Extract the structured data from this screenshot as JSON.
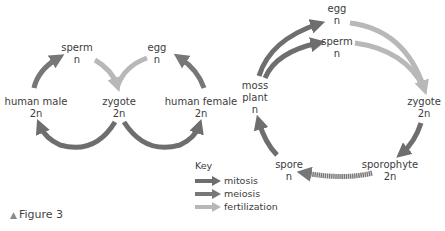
{
  "colors": {
    "mitosis": "#6e6e6e",
    "meiosis": "#7a7a7a",
    "fertilization": "#b8b8b8",
    "text": "#3c3c3c"
  },
  "human_cycle": {
    "sperm": {
      "name": "sperm",
      "ploidy": "n"
    },
    "egg": {
      "name": "egg",
      "ploidy": "n"
    },
    "male": {
      "name": "human male",
      "ploidy": "2n"
    },
    "female": {
      "name": "human female",
      "ploidy": "2n"
    },
    "zygote": {
      "name": "zygote",
      "ploidy": "2n"
    }
  },
  "moss_cycle": {
    "egg": {
      "name": "egg",
      "ploidy": "n"
    },
    "sperm": {
      "name": "sperm",
      "ploidy": "n"
    },
    "moss_plant": {
      "name_line1": "moss",
      "name_line2": "plant",
      "ploidy": "n"
    },
    "zygote": {
      "name": "zygote",
      "ploidy": "2n"
    },
    "sporophyte": {
      "name": "sporophyte",
      "ploidy": "2n"
    },
    "spore": {
      "name": "spore",
      "ploidy": "n"
    }
  },
  "key": {
    "title": "Key",
    "items": [
      {
        "label": "mitosis",
        "type": "mitosis"
      },
      {
        "label": "meiosis",
        "type": "meiosis"
      },
      {
        "label": "fertilization",
        "type": "fertilization"
      }
    ]
  },
  "caption": {
    "marker": "▲",
    "text": "Figure 3"
  }
}
